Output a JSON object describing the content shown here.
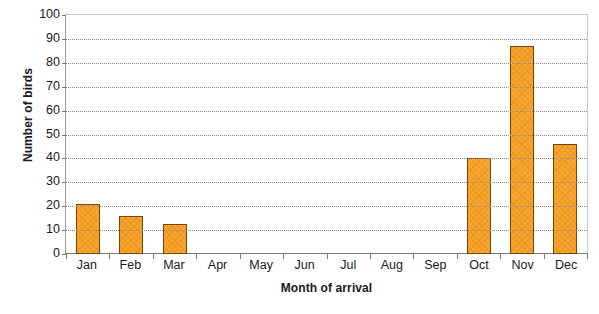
{
  "chart_data": {
    "type": "bar",
    "title": "",
    "xlabel": "Month of arrival",
    "ylabel": "Number of birds",
    "categories": [
      "Jan",
      "Feb",
      "Mar",
      "Apr",
      "May",
      "Jun",
      "Jul",
      "Aug",
      "Sep",
      "Oct",
      "Nov",
      "Dec"
    ],
    "values": [
      21,
      16,
      12.5,
      0,
      0,
      0,
      0,
      0,
      0,
      40,
      87,
      46
    ],
    "ylim": [
      0,
      100
    ],
    "ytick_labels": [
      "100",
      "90",
      "80",
      "70",
      "60",
      "50",
      "40",
      "30",
      "20",
      "10",
      "0"
    ],
    "ytick_values": [
      100,
      90,
      80,
      70,
      60,
      50,
      40,
      30,
      20,
      10,
      0
    ],
    "ystep": 10,
    "grid": true,
    "grid_style": "dotted horizontal",
    "legend": "none",
    "bar_fill_color": "#F7A72E",
    "bar_border_color": "#7B4310",
    "grid_color": "#8E8E8E",
    "axis_color": "#7A7A7A",
    "text_color": "#1A1A1A",
    "background_color": "#FFFFFF"
  }
}
